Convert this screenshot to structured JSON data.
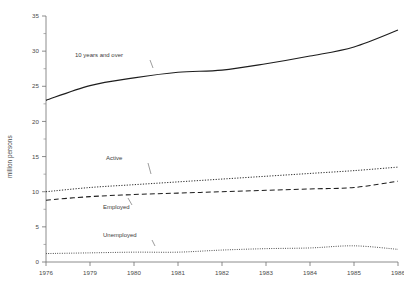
{
  "chart_data": {
    "type": "line",
    "title": "",
    "subtitle": "",
    "xlabel": "",
    "ylabel": "million persons",
    "xlim": [
      1976,
      1986
    ],
    "ylim": [
      0,
      35
    ],
    "grid": false,
    "legend_position": "inline-annotations",
    "x_tick_labels": [
      "1976",
      "1979",
      "1980",
      "1981",
      "1982",
      "1983",
      "1984",
      "1985",
      "1986"
    ],
    "x": [
      1976,
      1979,
      1980,
      1981,
      1982,
      1983,
      1984,
      1985,
      1986
    ],
    "y_tick_labels": [
      "0",
      "5",
      "10",
      "15",
      "20",
      "25",
      "30",
      "35"
    ],
    "y_ticks": [
      0,
      5,
      10,
      15,
      20,
      25,
      30,
      35
    ],
    "series": [
      {
        "name": "10 years and over",
        "style": "solid",
        "values": [
          23.0,
          25.1,
          26.2,
          27.0,
          27.3,
          28.2,
          29.3,
          30.6,
          33.0
        ]
      },
      {
        "name": "Active",
        "style": "dotted",
        "values": [
          10.0,
          10.6,
          11.0,
          11.4,
          11.8,
          12.2,
          12.6,
          13.0,
          13.5
        ]
      },
      {
        "name": "Employed",
        "style": "dashed",
        "values": [
          8.8,
          9.3,
          9.6,
          9.8,
          10.0,
          10.2,
          10.4,
          10.6,
          11.5
        ]
      },
      {
        "name": "Unemployed",
        "style": "dotted-fine",
        "values": [
          1.2,
          1.3,
          1.4,
          1.4,
          1.7,
          1.9,
          2.0,
          2.3,
          1.8
        ]
      }
    ],
    "annotations": [
      {
        "text": "10 years and over",
        "target_series": "10 years and over"
      },
      {
        "text": "Active",
        "target_series": "Active"
      },
      {
        "text": "Employed",
        "target_series": "Employed"
      },
      {
        "text": "Unemployed",
        "target_series": "Unemployed"
      }
    ]
  },
  "axes": {
    "y_title": "million persons"
  }
}
